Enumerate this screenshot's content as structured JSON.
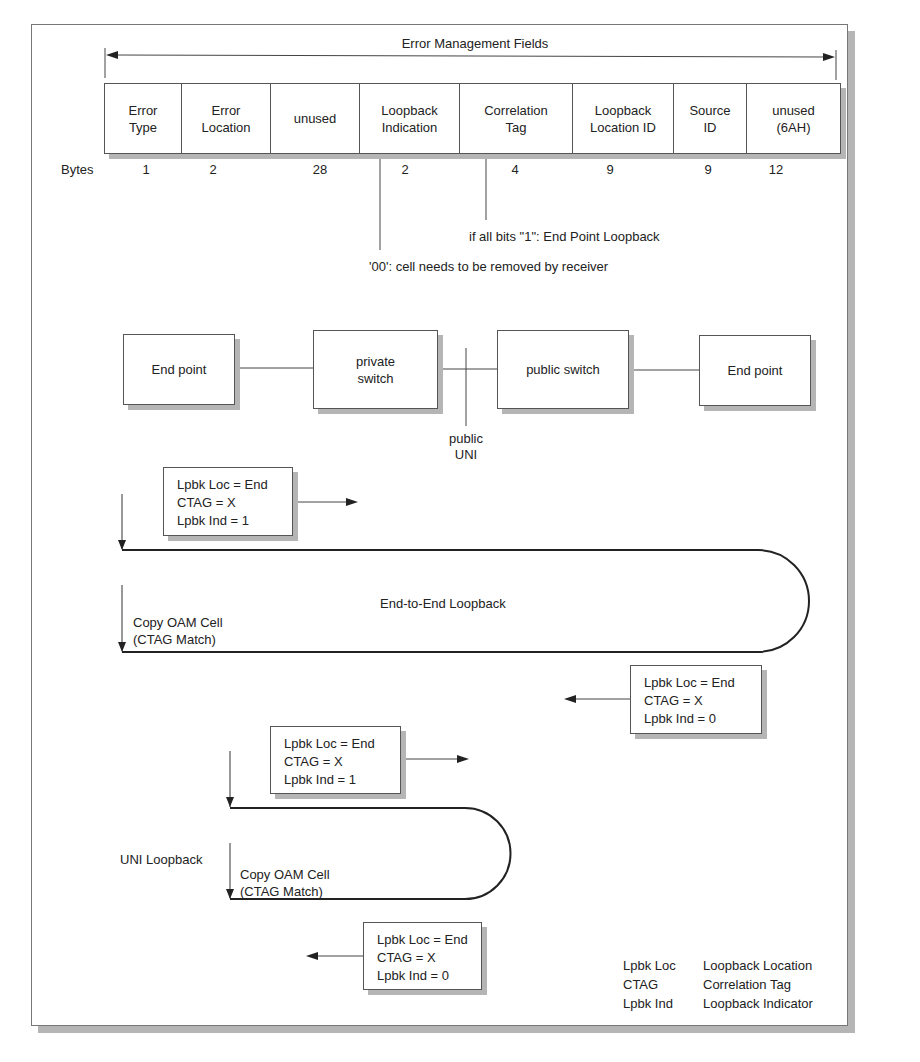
{
  "figure": {
    "header_label": "Error Management Fields",
    "bytes_label": "Bytes",
    "fields": [
      {
        "name": "Error Type",
        "line1": "Error",
        "line2": "Type",
        "bytes": "1"
      },
      {
        "name": "Error Location",
        "line1": "Error",
        "line2": "Location",
        "bytes": "2"
      },
      {
        "name": "unused",
        "line1": "unused",
        "line2": "",
        "bytes": "28"
      },
      {
        "name": "Loopback Indication",
        "line1": "Loopback",
        "line2": "Indication",
        "bytes": "2"
      },
      {
        "name": "Correlation Tag",
        "line1": "Correlation",
        "line2": "Tag",
        "bytes": "4"
      },
      {
        "name": "Loopback Location ID",
        "line1": "Loopback",
        "line2": "Location ID",
        "bytes": "9"
      },
      {
        "name": "Source ID",
        "line1": "Source",
        "line2": "ID",
        "bytes": "9"
      },
      {
        "name": "unused (6AH)",
        "line1": "unused",
        "line2": "(6AH)",
        "bytes": "12"
      }
    ],
    "annotations": {
      "correlation_tag_note": "if all bits \"1\": End Point Loopback",
      "loopback_indication_note": "'00': cell needs to be removed by receiver"
    },
    "topology": {
      "nodes": [
        {
          "id": "end-point-left",
          "line1": "End point",
          "line2": ""
        },
        {
          "id": "private-switch",
          "line1": "private",
          "line2": "switch"
        },
        {
          "id": "public-switch",
          "line1": "public switch",
          "line2": ""
        },
        {
          "id": "end-point-right",
          "line1": "End point",
          "line2": ""
        }
      ],
      "uni_label_line1": "public",
      "uni_label_line2": "UNI"
    },
    "end_to_end": {
      "title": "End-to-End Loopback",
      "copy_line1": "Copy OAM Cell",
      "copy_line2": "(CTAG Match)",
      "forward_msg": [
        "Lpbk Loc  = End",
        "CTAG  = X",
        "Lpbk Ind  = 1"
      ],
      "return_msg": [
        "Lpbk Loc  = End",
        "CTAG  = X",
        "Lpbk Ind  = 0"
      ]
    },
    "uni_loopback": {
      "title": "UNI Loopback",
      "copy_line1": "Copy OAM Cell",
      "copy_line2": "(CTAG Match)",
      "forward_msg": [
        "Lpbk Loc  = End",
        "CTAG  = X",
        "Lpbk Ind  = 1"
      ],
      "return_msg": [
        "Lpbk Loc  = End",
        "CTAG  = X",
        "Lpbk Ind  = 0"
      ]
    },
    "legend": [
      {
        "abbr": "Lpbk Loc",
        "meaning": "Loopback Location"
      },
      {
        "abbr": "CTAG",
        "meaning": "Correlation Tag"
      },
      {
        "abbr": "Lpbk Ind",
        "meaning": "Loopback Indicator"
      }
    ]
  }
}
